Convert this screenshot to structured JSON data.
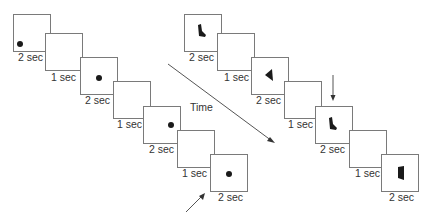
{
  "figure": {
    "time_label": "Time",
    "left_sequence": {
      "frames": [
        {
          "label": "2 sec",
          "content": "dot",
          "dot_position": "bottom-left"
        },
        {
          "label": "1 sec",
          "content": "blank"
        },
        {
          "label": "2 sec",
          "content": "dot",
          "dot_position": "center-right"
        },
        {
          "label": "1 sec",
          "content": "blank"
        },
        {
          "label": "2 sec",
          "content": "dot",
          "dot_position": "upper-right"
        },
        {
          "label": "1 sec",
          "content": "blank"
        },
        {
          "label": "2 sec",
          "content": "dot",
          "dot_position": "center"
        }
      ]
    },
    "right_sequence": {
      "frames": [
        {
          "label": "2 sec",
          "content": "shape",
          "shape": "boot-shape"
        },
        {
          "label": "1 sec",
          "content": "blank"
        },
        {
          "label": "2 sec",
          "content": "shape",
          "shape": "triangle"
        },
        {
          "label": "1 sec",
          "content": "blank"
        },
        {
          "label": "2 sec",
          "content": "shape",
          "shape": "boot-shape"
        },
        {
          "label": "1 sec",
          "content": "blank"
        },
        {
          "label": "2 sec",
          "content": "shape",
          "shape": "quadrilateral"
        }
      ]
    },
    "icons": {
      "time_arrow": "diagonal-arrow-icon",
      "target_arrow_left": "pointer-arrow-icon",
      "target_arrow_right": "down-arrow-icon"
    },
    "colors": {
      "frame_border": "#7a7a7a",
      "stimulus": "#1a1a1a",
      "text": "#333333"
    }
  }
}
